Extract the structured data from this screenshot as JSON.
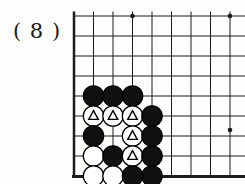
{
  "figure_label": "( 8 )",
  "board": {
    "description": "go-board-bottom-left-corner",
    "origin_x": 74,
    "top_y": 16,
    "col_spacing": 19.5,
    "row_spacing": 20,
    "cols": 9,
    "rows": 9,
    "line_color": "#1c1c1c",
    "line_thickness": 1,
    "edge_thickness": 3,
    "top_overhang_y": 11.5,
    "right_cut_x": 245,
    "stone_radius": 10.2,
    "stone_black_fill": "#111111",
    "stone_white_fill": "#ffffff",
    "stone_stroke": "#000000",
    "marker_shape": "triangle",
    "marker_color": "#000000",
    "star_points": [
      {
        "x": 132.5,
        "y": 16
      },
      {
        "x": 230,
        "y": 16
      },
      {
        "x": 230,
        "y": 130
      }
    ],
    "stones": [
      {
        "col": 2,
        "row": 5,
        "color": "black",
        "marked": false
      },
      {
        "col": 3,
        "row": 5,
        "color": "black",
        "marked": false
      },
      {
        "col": 4,
        "row": 5,
        "color": "black",
        "marked": false
      },
      {
        "col": 2,
        "row": 6,
        "color": "white",
        "marked": true
      },
      {
        "col": 3,
        "row": 6,
        "color": "white",
        "marked": true
      },
      {
        "col": 4,
        "row": 6,
        "color": "white",
        "marked": true
      },
      {
        "col": 5,
        "row": 6,
        "color": "black",
        "marked": false
      },
      {
        "col": 2,
        "row": 7,
        "color": "black",
        "marked": false
      },
      {
        "col": 4,
        "row": 7,
        "color": "white",
        "marked": true
      },
      {
        "col": 5,
        "row": 7,
        "color": "black",
        "marked": false
      },
      {
        "col": 2,
        "row": 8,
        "color": "white",
        "marked": false
      },
      {
        "col": 3,
        "row": 8,
        "color": "black",
        "marked": false
      },
      {
        "col": 4,
        "row": 8,
        "color": "white",
        "marked": true
      },
      {
        "col": 5,
        "row": 8,
        "color": "black",
        "marked": false
      },
      {
        "col": 2,
        "row": 9,
        "color": "white",
        "marked": false
      },
      {
        "col": 3,
        "row": 9,
        "color": "white",
        "marked": false
      },
      {
        "col": 4,
        "row": 9,
        "color": "black",
        "marked": false
      },
      {
        "col": 5,
        "row": 9,
        "color": "black",
        "marked": false
      }
    ]
  }
}
